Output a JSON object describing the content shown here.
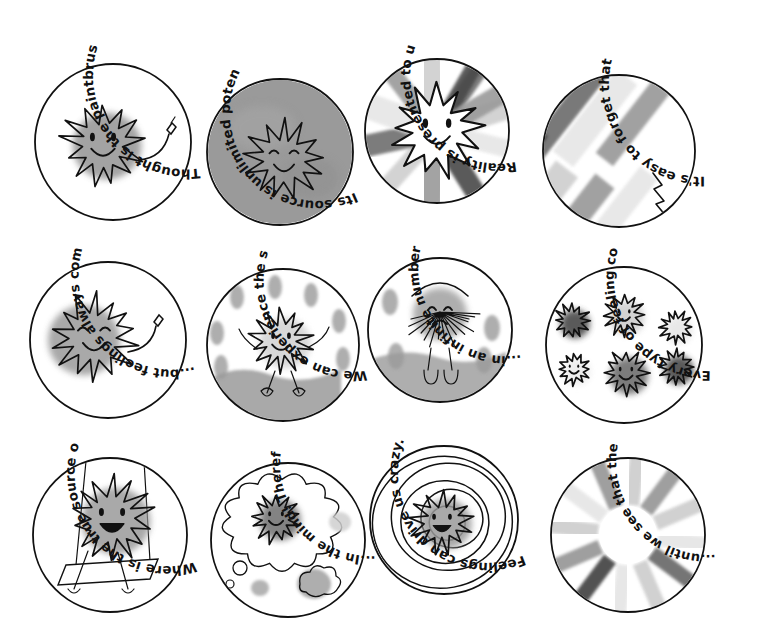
{
  "page": {
    "background_color": "#ffffff",
    "ink_color": "#111111",
    "grid": {
      "columns": 4,
      "rows": 3,
      "total_panels": 12
    }
  },
  "palette": {
    "ink": "#111111",
    "mid_gray": "#9a9a9a",
    "light_gray": "#cfcfcf",
    "pale_gray": "#e6e6e6",
    "dark_gray": "#6e6e6e",
    "deep_gray": "#4a4a4a",
    "paper": "#ffffff"
  },
  "panels": [
    {
      "index": 1,
      "caption": "Thought is the paintbrush of our experience.",
      "scene": "sun-character-with-paintbrush",
      "fill": "white",
      "row": 1,
      "col": 1
    },
    {
      "index": 2,
      "caption": "Its source is unlimited potential.",
      "scene": "sun-character-on-solid-gray-field",
      "fill": "mid-gray",
      "row": 1,
      "col": 2
    },
    {
      "index": 3,
      "caption": "Reality is presented to us via Thought.",
      "scene": "white-sun-character-over-colored-brush-rays",
      "fill": "brush-rays",
      "row": 1,
      "col": 3
    },
    {
      "index": 4,
      "caption": "It's easy to forget that Thought is behind it all...",
      "scene": "diagonal-paint-strokes-with-small-brush",
      "fill": "diagonal-strokes",
      "row": 1,
      "col": 4
    },
    {
      "index": 5,
      "caption": "...but feelings always come from a consistent source.",
      "scene": "smiling-sun-character-with-paintbrush",
      "fill": "white",
      "row": 2,
      "col": 1
    },
    {
      "index": 6,
      "caption": "We can experience the same situation...",
      "scene": "happy-sun-character-jumping-in-rain-puddles",
      "fill": "white",
      "row": 2,
      "col": 2
    },
    {
      "index": 7,
      "caption": "...in an infinite number of different ways.",
      "scene": "sad-drooping-sun-character-in-rain",
      "fill": "white",
      "row": 2,
      "col": 3
    },
    {
      "index": 8,
      "caption": "Every type of feeling comes to us in the same way.",
      "scene": "six-sun-characters-in-different-shades",
      "fill": "white",
      "row": 2,
      "col": 4
    },
    {
      "index": 9,
      "caption": "Where is the true source of experience?",
      "scene": "sun-character-on-a-swing",
      "fill": "white",
      "row": 3,
      "col": 1
    },
    {
      "index": 10,
      "caption": "...In the mind! Therefore everyone lives in a separate reality.",
      "scene": "sun-character-inside-a-thought-bubble",
      "fill": "white",
      "row": 3,
      "col": 2
    },
    {
      "index": 11,
      "caption": "Feelings can drive us crazy...",
      "scene": "sun-character-inside-concentric-spiral-rings",
      "fill": "white",
      "row": 3,
      "col": 3
    },
    {
      "index": 12,
      "caption": "...until we see that they are nothing more than Thought.",
      "scene": "radial-sunburst-of-gray-brush-petals",
      "fill": "radial-petals",
      "row": 3,
      "col": 4
    }
  ]
}
